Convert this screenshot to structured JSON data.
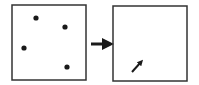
{
  "diagram": {
    "stroke_color": "#333333",
    "fill_color": "#1a1a1a",
    "left_panel": {
      "box": {
        "x": 12,
        "y": 5,
        "w": 74,
        "h": 75
      },
      "dots": [
        {
          "cx": 36,
          "cy": 18
        },
        {
          "cx": 65,
          "cy": 27
        },
        {
          "cx": 24,
          "cy": 48
        },
        {
          "cx": 67,
          "cy": 67
        }
      ]
    },
    "transition_arrow": {
      "x1": 91,
      "y1": 44,
      "x2": 108,
      "y2": 44
    },
    "right_panel": {
      "box": {
        "x": 113,
        "y": 6,
        "w": 74,
        "h": 75
      },
      "arrow": {
        "x1": 132,
        "y1": 72,
        "x2": 141,
        "y2": 62
      }
    }
  }
}
